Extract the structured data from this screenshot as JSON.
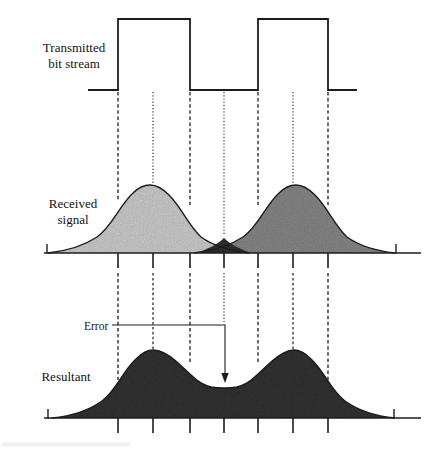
{
  "figure": {
    "labels": {
      "transmitted_line1": "Transmitted",
      "transmitted_line2": "bit stream",
      "received_line1": "Received",
      "received_line2": "signal",
      "resultant": "Resultant",
      "error": "Error"
    },
    "colors": {
      "pulse_left_fill": "#d8d8d8",
      "pulse_right_fill": "#8f8f8f",
      "overlap_fill": "#2b2b2b",
      "resultant_fill": "#373737",
      "line": "#1c1c1c"
    },
    "semantics": {
      "rows": [
        "Transmitted bit stream",
        "Received signal",
        "Resultant"
      ],
      "pulses_shown": 2,
      "sampling_guides": 7,
      "annotation": "Error arrow points to the dip between the two received pulses"
    }
  }
}
